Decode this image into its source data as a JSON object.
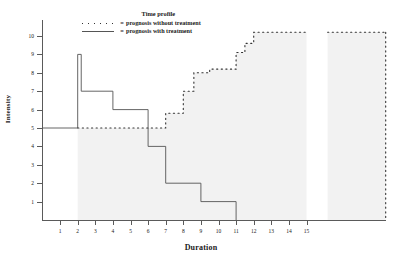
{
  "chart_data": {
    "type": "line",
    "title": "Time profile",
    "xlabel": "Duration",
    "ylabel": "Intensity",
    "xlim": [
      0,
      19.5
    ],
    "ylim": [
      0,
      10.6
    ],
    "xticks": [
      1,
      2,
      3,
      4,
      5,
      6,
      7,
      8,
      9,
      10,
      11,
      12,
      13,
      14,
      15
    ],
    "yticks": [
      1,
      2,
      3,
      4,
      5,
      6,
      7,
      8,
      9,
      10
    ],
    "grid": false,
    "legend_position": "top-center",
    "series": [
      {
        "name": "prognosis without treatment",
        "style": "dotted",
        "color": "#333333",
        "steps": [
          {
            "x0": 2.0,
            "x1": 7.0,
            "y": 5.0
          },
          {
            "x0": 7.0,
            "x1": 8.0,
            "y": 5.8
          },
          {
            "x0": 8.0,
            "x1": 8.6,
            "y": 7.0
          },
          {
            "x0": 8.6,
            "x1": 9.5,
            "y": 8.0
          },
          {
            "x0": 9.5,
            "x1": 11.0,
            "y": 8.2
          },
          {
            "x0": 11.0,
            "x1": 11.5,
            "y": 9.1
          },
          {
            "x0": 11.5,
            "x1": 12.0,
            "y": 9.6
          },
          {
            "x0": 12.0,
            "x1": 15.0,
            "y": 10.2
          },
          {
            "x0": 16.2,
            "x1": 19.5,
            "y": 10.2
          }
        ]
      },
      {
        "name": "prognosis with treatment",
        "style": "solid",
        "color": "#555555",
        "steps": [
          {
            "x0": 0.0,
            "x1": 2.0,
            "y": 5.0
          },
          {
            "x0": 2.0,
            "x1": 2.2,
            "y": 9.0
          },
          {
            "x0": 2.2,
            "x1": 4.0,
            "y": 7.0
          },
          {
            "x0": 4.0,
            "x1": 6.0,
            "y": 6.0
          },
          {
            "x0": 6.0,
            "x1": 7.0,
            "y": 4.0
          },
          {
            "x0": 7.0,
            "x1": 9.0,
            "y": 2.0
          },
          {
            "x0": 9.0,
            "x1": 11.0,
            "y": 1.0
          },
          {
            "x0": 11.0,
            "x1": 11.0,
            "y": 0.0
          }
        ]
      }
    ]
  },
  "legend": {
    "title": "Time profile",
    "equals": "=",
    "entries": [
      {
        "key": "dotted",
        "label": "prognosis without treatment"
      },
      {
        "key": "solid",
        "label": "prognosis with treatment"
      }
    ]
  },
  "axes": {
    "x_title": "Duration",
    "y_title": "Intensity",
    "x_tick_labels": [
      "1",
      "2",
      "3",
      "4",
      "5",
      "6",
      "7",
      "8",
      "9",
      "10",
      "11",
      "12",
      "13",
      "14",
      "15"
    ],
    "y_tick_labels": [
      "1",
      "2",
      "3",
      "4",
      "5",
      "6",
      "7",
      "8",
      "9",
      "10"
    ]
  }
}
